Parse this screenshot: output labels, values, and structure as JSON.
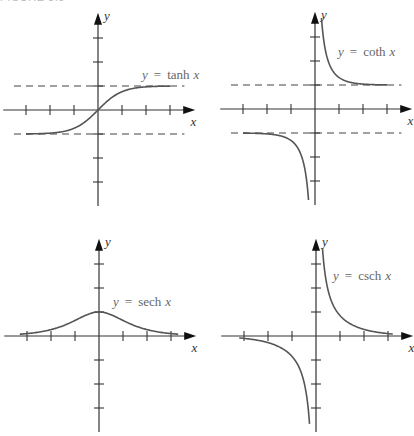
{
  "figure_label": "FIGURE 3.5",
  "chart_data": [
    {
      "type": "line",
      "title": "y = tanh x",
      "function": "tanh",
      "xlabel": "x",
      "ylabel": "y",
      "x_ticks": [
        -3,
        -2,
        -1,
        1,
        2,
        3
      ],
      "y_ticks": [
        -3,
        -2,
        -1,
        1,
        2,
        3
      ],
      "asymptotes_horizontal": [
        1,
        -1
      ],
      "asymptotes_vertical": [],
      "domain": [
        -3,
        3
      ],
      "sample_points": [
        [
          -3,
          -0.995
        ],
        [
          -2,
          -0.964
        ],
        [
          -1,
          -0.762
        ],
        [
          0,
          0
        ],
        [
          1,
          0.762
        ],
        [
          2,
          0.964
        ],
        [
          3,
          0.995
        ]
      ],
      "grid": false,
      "origin_px": [
        98,
        110
      ],
      "unit_px": 24,
      "label_pos_px": [
        142,
        79
      ]
    },
    {
      "type": "line",
      "title": "y = coth x",
      "function": "coth",
      "xlabel": "x",
      "ylabel": "y",
      "x_ticks": [
        -3,
        -2,
        -1,
        1,
        2,
        3
      ],
      "y_ticks": [
        -3,
        -2,
        -1,
        1,
        2,
        3
      ],
      "asymptotes_horizontal": [
        1,
        -1
      ],
      "asymptotes_vertical": [
        0
      ],
      "domain": [
        [
          -3,
          -0.27
        ],
        [
          0.27,
          3
        ]
      ],
      "sample_points": [
        [
          -3,
          -1.005
        ],
        [
          -2,
          -1.037
        ],
        [
          -1,
          -1.313
        ],
        [
          -0.5,
          -2.164
        ],
        [
          0.5,
          2.164
        ],
        [
          1,
          1.313
        ],
        [
          2,
          1.037
        ],
        [
          3,
          1.005
        ]
      ],
      "grid": false,
      "origin_px": [
        315,
        109
      ],
      "unit_px": 24,
      "label_pos_px": [
        338,
        56
      ]
    },
    {
      "type": "line",
      "title": "y = sech x",
      "function": "sech",
      "xlabel": "x",
      "ylabel": "y",
      "x_ticks": [
        -3,
        -2,
        -1,
        1,
        2,
        3
      ],
      "y_ticks": [
        -3,
        -2,
        -1,
        1,
        2,
        3
      ],
      "asymptotes_horizontal": [],
      "asymptotes_vertical": [],
      "domain": [
        -3.3,
        3.3
      ],
      "sample_points": [
        [
          -3,
          0.099
        ],
        [
          -2,
          0.266
        ],
        [
          -1,
          0.648
        ],
        [
          0,
          1
        ],
        [
          1,
          0.648
        ],
        [
          2,
          0.266
        ],
        [
          3,
          0.099
        ]
      ],
      "grid": false,
      "origin_px": [
        99,
        336
      ],
      "unit_px": 24,
      "label_pos_px": [
        113,
        306
      ]
    },
    {
      "type": "line",
      "title": "y = csch x",
      "function": "csch",
      "xlabel": "x",
      "ylabel": "y",
      "x_ticks": [
        -3,
        -2,
        -1,
        1,
        2,
        3
      ],
      "y_ticks": [
        -3,
        -2,
        -1,
        1,
        2,
        3
      ],
      "asymptotes_horizontal": [],
      "asymptotes_vertical": [
        0
      ],
      "domain": [
        [
          -3.2,
          -0.27
        ],
        [
          0.27,
          3.2
        ]
      ],
      "sample_points": [
        [
          -3,
          -0.1
        ],
        [
          -2,
          -0.276
        ],
        [
          -1,
          -0.851
        ],
        [
          -0.5,
          -1.919
        ],
        [
          0.5,
          1.919
        ],
        [
          1,
          0.851
        ],
        [
          2,
          0.276
        ],
        [
          3,
          0.1
        ]
      ],
      "grid": false,
      "origin_px": [
        316,
        336
      ],
      "unit_px": 24,
      "label_pos_px": [
        333,
        280
      ]
    }
  ],
  "labels": {
    "eq_prefix": "y",
    "eq_sign": "=",
    "var": "x",
    "fn_names": [
      "tanh",
      "coth",
      "sech",
      "csch"
    ],
    "x_axis": "x",
    "y_axis": "y"
  }
}
